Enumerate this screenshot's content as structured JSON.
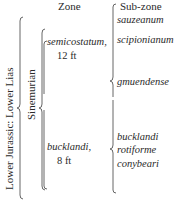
{
  "headers": {
    "zone": "Zone",
    "subzone": "Sub-zone"
  },
  "series": "Lower Jurassic: Lower Lias",
  "stage": "Sinemurian",
  "zones": [
    {
      "name": "semicostatum,",
      "thickness": "12 ft",
      "subzones": [
        "sauzeanum",
        "scipionianum",
        "gmuendense"
      ]
    },
    {
      "name": "bucklandi,",
      "thickness": "8 ft",
      "subzones": [
        "bucklandi",
        "rotiforme",
        "conybeari"
      ]
    }
  ]
}
